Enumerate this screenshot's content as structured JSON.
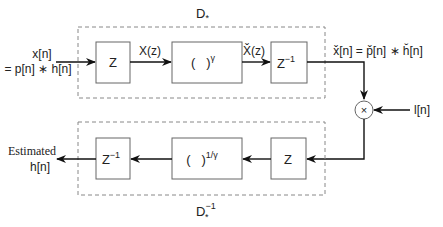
{
  "diagram": {
    "type": "block-diagram",
    "top_group": {
      "label": "D",
      "label_sub": "*",
      "blocks": [
        {
          "id": "z-transform",
          "label": "Z",
          "sup": ""
        },
        {
          "id": "power",
          "label": "(   )",
          "sup": "γ"
        },
        {
          "id": "inverse-z",
          "label": "Z",
          "sup": "−1"
        }
      ],
      "edges": [
        {
          "label": "X(z)"
        },
        {
          "label": "X̌(z)"
        }
      ]
    },
    "bottom_group": {
      "label": "D",
      "label_sub": "*",
      "label_sup": "−1",
      "blocks": [
        {
          "id": "z-transform-2",
          "label": "Z",
          "sup": ""
        },
        {
          "id": "power-inv",
          "label": "(   )",
          "sup": "1/γ"
        },
        {
          "id": "inverse-z-2",
          "label": "Z",
          "sup": "−1"
        }
      ]
    },
    "input_label_line1": "x[n]",
    "input_label_line2": "= p[n] ∗ h[n]",
    "output_top_label": "x̌[n] = p̌[n] ∗ ȟ[n]",
    "multiplier_symbol": "×",
    "lifter_label": "l[n]",
    "output_label_line1": "Estimated",
    "output_label_line2": "h[n]"
  }
}
